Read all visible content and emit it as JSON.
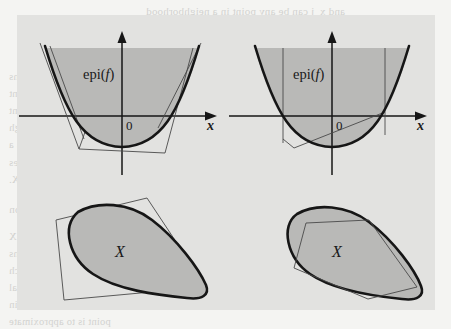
{
  "page": {
    "background_color": "#f4f4f2",
    "figure_panel_color": "#e2e2e0",
    "shaded_region_color": "#b9b9b7",
    "curve_color": "#161616",
    "thin_line_color": "#4a4a4a"
  },
  "bleed_text": {
    "note": "faint mirrored show-through text of the reverse book page",
    "lines": [
      {
        "text": "and x_j can be any point in a neighborhood",
        "x": 146,
        "y": 5,
        "style": "hdr"
      },
      {
        "text": "x_{j+1} = x_j + a_j d_j,",
        "x": 186,
        "y": 33,
        "style": ""
      },
      {
        "text": "In Chapter 4 it may be shown that under mild conditions",
        "x": 9,
        "y": 71,
        "style": ""
      },
      {
        "text": "Cutting plane and extreme point methods are convergent",
        "x": 9,
        "y": 88,
        "style": ""
      },
      {
        "text": "are used. Or it may be that a method which is not convergent",
        "x": 9,
        "y": 105,
        "style": ""
      },
      {
        "text": "and provides a good bound on the optimal value, is enough",
        "x": 9,
        "y": 122,
        "style": ""
      },
      {
        "text": "in practice. It is also possible that the problem admits a",
        "x": 9,
        "y": 139,
        "style": ""
      },
      {
        "text": "substructure which ensures that the procedure terminates",
        "x": 9,
        "y": 157,
        "style": ""
      },
      {
        "text": "this Chapter as an exercise that for any x in X.",
        "x": 9,
        "y": 174,
        "style": ""
      },
      {
        "text": "3.4.1   Polyhedral Approximation",
        "x": 9,
        "y": 203,
        "style": "hdr"
      },
      {
        "text": "In polyhedral approximation methods X",
        "x": 9,
        "y": 231,
        "style": ""
      },
      {
        "text": "inner or outer polyhedral approximations",
        "x": 9,
        "y": 248,
        "style": ""
      },
      {
        "text": "may be split into subproblems, each of which",
        "x": 9,
        "y": 265,
        "style": ""
      },
      {
        "text": "solvable subproblem. The set admits polyhedral",
        "x": 9,
        "y": 282,
        "style": ""
      },
      {
        "text": "the generated points in the figure. To obtain",
        "x": 9,
        "y": 299,
        "style": ""
      },
      {
        "text": "point is to approximate",
        "x": 9,
        "y": 316,
        "style": ""
      }
    ]
  },
  "figure": {
    "panels": [
      {
        "id": "top-left",
        "name": "outer-linearization-of-epigraph",
        "labels": {
          "region": "epi(f)",
          "region_prefix": "epi(",
          "region_var": "f",
          "region_suffix": ")",
          "origin": "0",
          "axis_x": "x"
        }
      },
      {
        "id": "top-right",
        "name": "inner-linearization-of-epigraph",
        "labels": {
          "region": "epi(f)",
          "region_prefix": "epi(",
          "region_var": "f",
          "region_suffix": ")",
          "origin": "0",
          "axis_x": "x"
        }
      },
      {
        "id": "bottom-left",
        "name": "outer-polyhedral-approximation-of-set",
        "labels": {
          "region": "X"
        }
      },
      {
        "id": "bottom-right",
        "name": "inner-polyhedral-approximation-of-set",
        "labels": {
          "region": "X"
        }
      }
    ]
  },
  "chart_data": {
    "type": "diagram",
    "panels": [
      {
        "id": "top-left",
        "kind": "epigraph-outer-linearization",
        "shaded_region_label": "epi(f)",
        "axes": {
          "x_label": "x",
          "origin_label": "0",
          "x_arrow": true,
          "y_arrow": true
        },
        "curve": {
          "type": "parabola",
          "description": "convex function f, vertex near origin slightly below x-axis"
        },
        "cuts": [
          {
            "name": "tangent-left-steep",
            "description": "tangent line on far left branch"
          },
          {
            "name": "tangent-bottom-left",
            "description": "tangent under left of vertex"
          },
          {
            "name": "tangent-bottom",
            "description": "near-horizontal tangent below vertex"
          },
          {
            "name": "tangent-right",
            "description": "tangent on right branch"
          }
        ],
        "cut_count": 4
      },
      {
        "id": "top-right",
        "kind": "epigraph-inner-linearization",
        "shaded_region_label": "epi(f)",
        "axes": {
          "x_label": "x",
          "origin_label": "0",
          "x_arrow": true,
          "y_arrow": true
        },
        "curve": {
          "type": "parabola",
          "description": "convex function f, vertex near origin slightly below x-axis"
        },
        "chords": [
          {
            "name": "vertical-ray-left",
            "description": "vertical line upward from left sample point"
          },
          {
            "name": "vertical-ray-right",
            "description": "vertical line upward from right sample point"
          },
          {
            "name": "chord",
            "description": "chord from left-lower point to right branch point"
          }
        ],
        "sample_point_count": 2
      },
      {
        "id": "bottom-left",
        "kind": "set-outer-approximation",
        "shaded_region_label": "X",
        "outline": {
          "type": "convex-blob",
          "description": "smooth egg/oval tilted shape"
        },
        "approximation": {
          "type": "circumscribed-polygon",
          "sides": 4,
          "description": "quadrilateral containing the blob"
        }
      },
      {
        "id": "bottom-right",
        "kind": "set-inner-approximation",
        "shaded_region_label": "X",
        "outline": {
          "type": "convex-blob",
          "description": "smooth egg/oval tilted shape"
        },
        "approximation": {
          "type": "inscribed-polygon",
          "sides": 5,
          "description": "pentagon inscribed in the blob"
        }
      }
    ]
  }
}
